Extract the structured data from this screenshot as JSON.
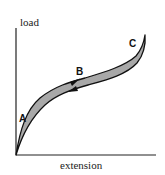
{
  "diagram": {
    "type": "hysteresis-loop",
    "y_axis_label": "load",
    "x_axis_label": "extension",
    "points": {
      "A": "A",
      "B": "B",
      "C": "C"
    },
    "colors": {
      "fill": "#a8a8a8",
      "stroke": "#111111",
      "background": "#ffffff"
    }
  }
}
